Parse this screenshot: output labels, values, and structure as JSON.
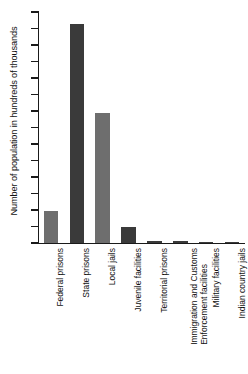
{
  "chart_data": {
    "type": "bar",
    "title": "",
    "xlabel": "",
    "ylabel": "Number of population in hundreds of thousands",
    "ylim": [
      0,
      14
    ],
    "ytick_step": 1,
    "grid": false,
    "legend": "none",
    "yticks": [
      "14",
      "13",
      "12",
      "11",
      "10",
      "9",
      "8",
      "7",
      "6",
      "5",
      "4",
      "3",
      "2",
      "1",
      "0"
    ],
    "categories": [
      "Federal prisons",
      "State prisons",
      "Local jails",
      "Juvenile facilities",
      "Territorial prisons",
      "Immigration and Customs Enforcement facilities",
      "Military facilities",
      "Indian country jails"
    ],
    "category_lines": [
      [
        "Federal prisons"
      ],
      [
        "State prisons"
      ],
      [
        "Local jails"
      ],
      [
        "Juvenile facilities"
      ],
      [
        "Territorial prisons"
      ],
      [
        "Immigration and Customs",
        "Enforcement facilities"
      ],
      [
        "Military facilities"
      ],
      [
        "Indian country jails"
      ]
    ],
    "values": [
      1.95,
      13.3,
      7.9,
      1.0,
      0.15,
      0.15,
      0.02,
      0.02
    ],
    "bar_colors": [
      "#6e6e6e",
      "#3a3a3a",
      "#6e6e6e",
      "#3a3a3a",
      "#3a3a3a",
      "#3a3a3a",
      "#3a3a3a",
      "#3a3a3a"
    ]
  },
  "colors": {
    "axis": "#1a1a1a",
    "background": "#ffffff",
    "bar_light": "#6e6e6e",
    "bar_dark": "#3a3a3a"
  }
}
